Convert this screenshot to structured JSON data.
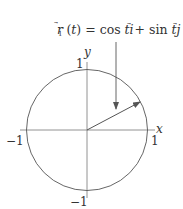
{
  "diagram": {
    "equation": {
      "lhs": "r⃗₁ (t)",
      "eq": "=",
      "rhs": "cos t i⃗ + sin t j⃗",
      "full": "r⃗₁ (t) = cos t i⃗ + sin t j⃗"
    },
    "axes": {
      "x_label": "x",
      "y_label": "y",
      "x_tick_pos": "1",
      "x_tick_neg": "−1",
      "y_tick_pos": "1",
      "y_tick_neg": "−1"
    },
    "circle": {
      "center": [
        0,
        0
      ],
      "radius": 1
    },
    "vector": {
      "angle_deg": 28,
      "description": "position vector from origin to point on unit circle"
    },
    "colors": {
      "stroke": "#555555",
      "text": "#333333",
      "background": "#ffffff"
    }
  }
}
